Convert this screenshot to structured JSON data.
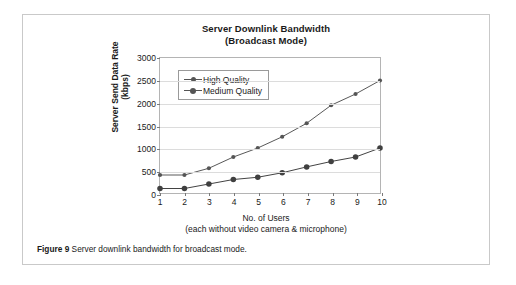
{
  "figure": {
    "caption_label": "Figure 9",
    "caption_text": "Server downlink bandwidth for broadcast mode."
  },
  "chart_data": {
    "type": "line",
    "title": "Server Downlink Bandwidth",
    "subtitle": "(Broadcast Mode)",
    "xlabel": "No. of Users",
    "xlabel_note": "(each without video camera & microphone)",
    "ylabel": "Server Send Data Rate",
    "ylabel_units": "(kbps)",
    "categories": [
      1,
      2,
      3,
      4,
      5,
      6,
      7,
      8,
      9,
      10
    ],
    "x_tick_labels": [
      "1",
      "2",
      "3",
      "4",
      "5",
      "6",
      "7",
      "8",
      "9",
      "10"
    ],
    "y_tick_labels": [
      "0",
      "500",
      "1000",
      "1500",
      "2000",
      "2500",
      "3000"
    ],
    "y_ticks": [
      0,
      500,
      1000,
      1500,
      2000,
      2500,
      3000
    ],
    "ylim": [
      0,
      3000
    ],
    "xlim": [
      1,
      10
    ],
    "grid": "horizontal",
    "legend_position": "top-left-inside",
    "series": [
      {
        "name": "High Quality",
        "marker": "diamond-small",
        "color": "#555555",
        "values": [
          400,
          400,
          550,
          800,
          1000,
          1250,
          1550,
          1950,
          2200,
          2500
        ]
      },
      {
        "name": "Medium Quality",
        "marker": "diamond-filled",
        "color": "#404040",
        "values": [
          100,
          100,
          200,
          300,
          350,
          450,
          580,
          700,
          800,
          1000
        ]
      }
    ]
  }
}
